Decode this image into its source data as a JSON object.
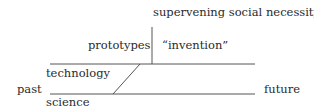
{
  "diagram": {
    "labels": {
      "top": "supervening social necessity",
      "prototypes": "prototypes",
      "invention": "“invention”",
      "technology": "technology",
      "past": "past",
      "science": "science",
      "future": "future"
    },
    "lines": {
      "technology_line": {
        "x1": 50,
        "y1": 64,
        "x2": 255,
        "y2": 64
      },
      "science_line": {
        "x1": 50,
        "y1": 94,
        "x2": 255,
        "y2": 94
      },
      "diagonal": {
        "x1": 113,
        "y1": 94,
        "x2": 140,
        "y2": 64
      },
      "vertical": {
        "x1": 152,
        "y1": 27,
        "x2": 152,
        "y2": 64
      }
    },
    "line_color": "#555555"
  }
}
